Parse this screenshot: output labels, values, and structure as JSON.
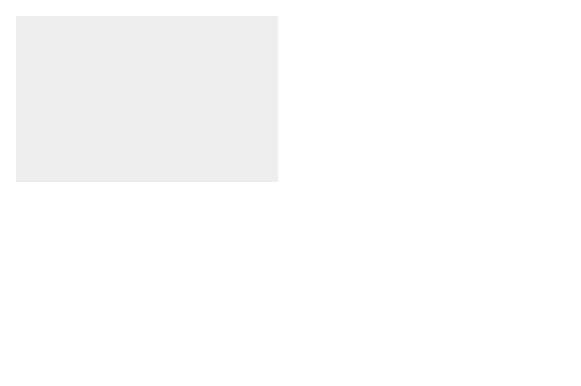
{
  "colors": {
    "background": "#eeeeee",
    "label_bg": "#dcdcdc",
    "dark": "#4a4a4a",
    "tissue": "#a8a8a8",
    "islet": "#5e5e5e",
    "text": "#5a5a5a"
  },
  "steps": [
    {
      "id": 1,
      "label": "Donor\npancreas (1)"
    },
    {
      "id": 2,
      "label": "Organ\nprocurement (2)"
    },
    {
      "id": 3,
      "label": "Arrival at an\nislet isolation\nfacility (3)"
    },
    {
      "id": 4,
      "label": "Enzyme\ninfusion (4)"
    },
    {
      "id": 5,
      "label": "Pancreas\ndigestion (5)"
    },
    {
      "id": 6,
      "label": "Gradient\nseparation (6)"
    },
    {
      "id": 7,
      "label": "Islets collected\nin infusion\nbag (7)"
    },
    {
      "id": 8,
      "label": "Portal vein\ninfusion (8)"
    },
    {
      "id": 9,
      "label": "Islet engraftment\nand survival (9)"
    }
  ],
  "annotations": {
    "islets_donor": "Islets in vivo:\ndonor",
    "islets_recipient": "Islets in vivo:\nrecipient",
    "skin": "Skin",
    "portal_vein": "Portal vein",
    "blood_flow": "Blood flow"
  }
}
